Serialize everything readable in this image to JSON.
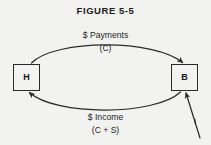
{
  "figure": {
    "title": "FIGURE 5-5",
    "background_color": "#f2f2f0",
    "ink_color": "#2a2a2a"
  },
  "nodes": [
    {
      "id": "household",
      "label": "H",
      "position": "left"
    },
    {
      "id": "business",
      "label": "B",
      "position": "right"
    }
  ],
  "edges": {
    "top": {
      "label": "$ Payments",
      "sublabel": "(C)",
      "direction": "H to B",
      "arrowhead": "at-B"
    },
    "bottom": {
      "label": "$ Income",
      "sublabel": "(C + S)",
      "direction": "B to H",
      "arrowhead": "at-H"
    },
    "injection": {
      "label": "I",
      "direction": "into B",
      "arrowhead": "at-B-bottom"
    }
  }
}
